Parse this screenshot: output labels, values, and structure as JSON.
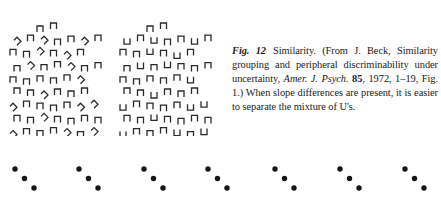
{
  "figure": {
    "label": "Fig. 12",
    "caption_title": "Similarity.",
    "caption_source_pre": "(From J. Beck, Similarity grouping and peripheral discriminability under uncertainty,",
    "journal": "Amer. J. Psych.",
    "volume": "85",
    "caption_source_post": ", 1972, 1–19, Fig. 1.) When slope differences are present, it is easier to separate the mixture of U's."
  },
  "panels": {
    "left": {
      "description": "Field of upright U shapes with tilted U shapes mixed in",
      "distractor": "tilted-u",
      "rows": [
        "  n n",
        "s n s n n s n",
        "n n s n s n",
        "n s n n s n n",
        "n n n n n s",
        "n n s n n n",
        "s n n n n s s",
        "n n s n n n n",
        "s n n n s n s"
      ]
    },
    "right": {
      "description": "Field of upright U shapes with inverted U shapes mixed in",
      "distractor": "inverted-u",
      "rows": [
        "  n n",
        "u n u n n u n",
        "n n u n u n",
        "n u n u n n n",
        "n n n n n u",
        "n n u n n n",
        "u n n n n u u",
        "n n u n n n n",
        "u n n n u n u"
      ]
    }
  },
  "dot_groups": {
    "count": 7,
    "description": "Seven diagonal triplets of dots",
    "x_positions": [
      15,
      79,
      144,
      208,
      275,
      340,
      405
    ]
  }
}
